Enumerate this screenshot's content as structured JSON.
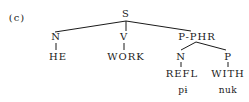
{
  "diagram": {
    "label": "(c)",
    "root": "S",
    "nodes": {
      "s": "S",
      "n1": "N",
      "v": "V",
      "pphr": "P-PHR",
      "he": "HE",
      "work": "WORK",
      "n2": "N",
      "p": "P",
      "refl": "REFL",
      "with": "WITH",
      "pi": "pɨ",
      "nuk": "nuk"
    },
    "edges": [
      [
        "S",
        "N"
      ],
      [
        "S",
        "V"
      ],
      [
        "S",
        "P-PHR"
      ],
      [
        "N",
        "HE"
      ],
      [
        "V",
        "WORK"
      ],
      [
        "P-PHR",
        "N"
      ],
      [
        "P-PHR",
        "P"
      ],
      [
        "N",
        "REFL"
      ],
      [
        "P",
        "WITH"
      ]
    ]
  }
}
